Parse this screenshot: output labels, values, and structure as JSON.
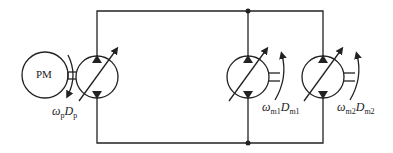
{
  "diagram": {
    "prime_mover": {
      "label": "PM"
    },
    "pump": {
      "speed_symbol": "ω",
      "speed_sub": "p",
      "disp_symbol": "D",
      "disp_sub": "p"
    },
    "motor1": {
      "speed_symbol": "ω",
      "speed_sub": "m1",
      "disp_symbol": "D",
      "disp_sub": "m1"
    },
    "motor2": {
      "speed_symbol": "ω",
      "speed_sub": "m2",
      "disp_symbol": "D",
      "disp_sub": "m2"
    },
    "colors": {
      "line": "#222222",
      "background": "#ffffff"
    }
  }
}
